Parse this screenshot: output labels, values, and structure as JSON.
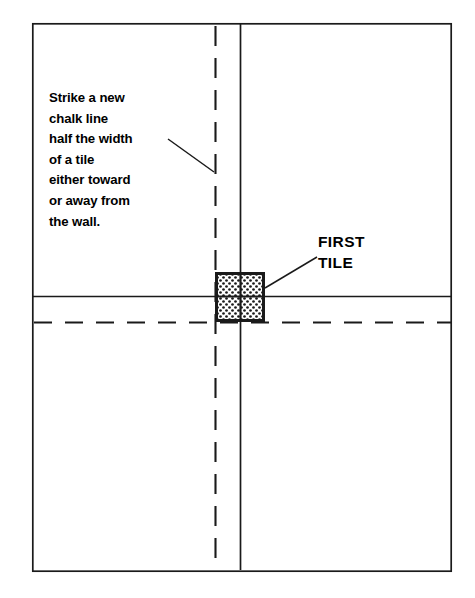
{
  "figure": {
    "kind": "floor-tile-layout-diagram",
    "background_color": "#ffffff",
    "ink_color": "#1a1a1a",
    "border": {
      "x": 32,
      "y": 23,
      "width": 420,
      "height": 549,
      "stroke_width": 1.6
    }
  },
  "annotations": {
    "instruction_note": "Strike a new\nchalk line\nhalf the width\nof a tile\neither toward\nor away from\nthe wall.",
    "instruction_lines": [
      "Strike a new",
      "chalk line",
      "half the width",
      "of a tile",
      "either toward",
      "or away from",
      "the wall."
    ],
    "first_tile_label": "FIRST\nTILE",
    "first_tile_label_lines": [
      "FIRST",
      "TILE"
    ]
  },
  "guides": {
    "new_chalk_line_vertical": {
      "name": "new-chalk-line-vertical",
      "style": "dashed",
      "x": 215.5,
      "y1": 23,
      "y2": 572,
      "dash": "20 12"
    },
    "original_chalk_line_vertical": {
      "name": "original-chalk-line-vertical",
      "style": "solid",
      "x": 240.5,
      "y1": 23,
      "y2": 572
    },
    "original_chalk_line_horizontal": {
      "name": "original-chalk-line-horizontal",
      "style": "solid",
      "y": 296.5,
      "x1": 32,
      "x2": 452
    },
    "new_chalk_line_horizontal": {
      "name": "new-chalk-line-horizontal",
      "style": "dashed",
      "y": 322.5,
      "x1": 32,
      "x2": 452,
      "dash": "18 13"
    }
  },
  "first_tile": {
    "x": 215,
    "y": 272,
    "width": 50,
    "height": 50,
    "fill_pattern": "dot-stipple",
    "stroke_width": 3
  },
  "leaders": [
    {
      "name": "note-leader-line",
      "x1": 168,
      "y1": 139,
      "x2": 214,
      "y2": 172
    },
    {
      "name": "first-tile-leader-line",
      "x1": 266,
      "y1": 288,
      "x2": 317,
      "y2": 257
    }
  ]
}
